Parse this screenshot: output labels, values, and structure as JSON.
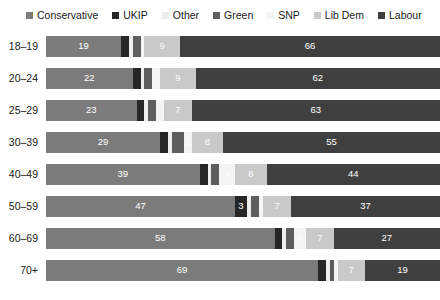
{
  "legend": {
    "position": "top-left",
    "items": [
      {
        "label": "Conservative",
        "color": "#7b7b7b"
      },
      {
        "label": "UKIP",
        "color": "#262626"
      },
      {
        "label": "Other",
        "color": "#eeeeee"
      },
      {
        "label": "Green",
        "color": "#5e5e5e"
      },
      {
        "label": "SNP",
        "color": "#f4f4f4"
      },
      {
        "label": "Lib Dem",
        "color": "#c9c9c9"
      },
      {
        "label": "Labour",
        "color": "#3f3f3f"
      }
    ]
  },
  "chart_data": {
    "type": "bar",
    "orientation": "horizontal",
    "stacked": true,
    "stack_total": 100,
    "title": "",
    "subtitle": "",
    "xlabel": "",
    "ylabel": "",
    "xlim": [
      0,
      100
    ],
    "grid": false,
    "legend_position": "top-left",
    "categories": [
      "18–19",
      "20–24",
      "25–29",
      "30–39",
      "40–49",
      "50–59",
      "60–69",
      "70+"
    ],
    "series": [
      {
        "name": "Conservative",
        "color": "#7b7b7b",
        "values": [
          19,
          22,
          23,
          29,
          39,
          47,
          58,
          69
        ]
      },
      {
        "name": "UKIP",
        "color": "#262626",
        "values": [
          2,
          2,
          2,
          2,
          2,
          3,
          2,
          2
        ]
      },
      {
        "name": "Other",
        "color": "#eeeeee",
        "values": [
          1,
          1,
          1,
          1,
          1,
          1,
          1,
          1
        ]
      },
      {
        "name": "Green",
        "color": "#5e5e5e",
        "values": [
          2,
          2,
          2,
          3,
          2,
          2,
          2,
          1
        ]
      },
      {
        "name": "SNP",
        "color": "#f4f4f4",
        "values": [
          1,
          2,
          2,
          2,
          4,
          1,
          3,
          1
        ]
      },
      {
        "name": "Lib Dem",
        "color": "#c9c9c9",
        "values": [
          9,
          9,
          7,
          8,
          8,
          7,
          7,
          7
        ]
      },
      {
        "name": "Labour",
        "color": "#3f3f3f",
        "values": [
          66,
          62,
          63,
          55,
          44,
          37,
          27,
          19
        ]
      }
    ],
    "labeled_values": {
      "18–19": {
        "Conservative": "19",
        "UKIP": "",
        "Other": "",
        "Green": "",
        "SNP": "",
        "Lib Dem": "9",
        "Labour": "66"
      },
      "20–24": {
        "Conservative": "22",
        "UKIP": "",
        "Other": "",
        "Green": "",
        "SNP": "",
        "Lib Dem": "9",
        "Labour": "62"
      },
      "25–29": {
        "Conservative": "23",
        "UKIP": "",
        "Other": "",
        "Green": "",
        "SNP": "",
        "Lib Dem": "7",
        "Labour": "63"
      },
      "30–39": {
        "Conservative": "29",
        "UKIP": "",
        "Other": "",
        "Green": "",
        "SNP": "2",
        "Lib Dem": "8",
        "Labour": "55"
      },
      "40–49": {
        "Conservative": "39",
        "UKIP": "",
        "Other": "",
        "Green": "",
        "SNP": "4",
        "Lib Dem": "8",
        "Labour": "44"
      },
      "50–59": {
        "Conservative": "47",
        "UKIP": "3",
        "Other": "",
        "Green": "",
        "SNP": "1",
        "Lib Dem": "7",
        "Labour": "37"
      },
      "60–69": {
        "Conservative": "58",
        "UKIP": "",
        "Other": "",
        "Green": "",
        "SNP": "3",
        "Lib Dem": "7",
        "Labour": "27"
      },
      "70+": {
        "Conservative": "69",
        "UKIP": "",
        "Other": "",
        "Green": "",
        "SNP": "",
        "Lib Dem": "7",
        "Labour": "19"
      }
    }
  }
}
